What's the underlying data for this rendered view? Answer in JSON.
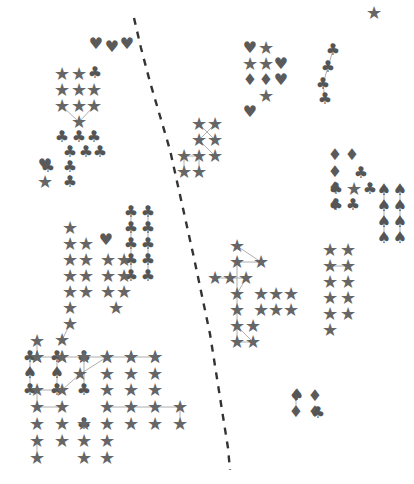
{
  "chart_data": {
    "type": "scatter",
    "title": "",
    "subtitle": "",
    "xlabel": "",
    "ylabel": "",
    "xlim": [
      0,
      414
    ],
    "ylim": [
      0,
      484
    ],
    "grid": false,
    "legend": "none",
    "background_color": "#ffffff",
    "marker_colors": {
      "star": "#666666",
      "club": "#555555",
      "spade": "#555555",
      "heart": "#5a5a5a",
      "diamond": "#5a5a5a"
    },
    "edge_color": "#999999",
    "divider_color": "#333333",
    "glyph_legend": [
      {
        "name": "star",
        "symbol": "★",
        "label": "star"
      },
      {
        "name": "club",
        "symbol": "♣",
        "label": "club"
      },
      {
        "name": "spade",
        "symbol": "♠",
        "label": "spade"
      },
      {
        "name": "heart",
        "symbol": "♥",
        "label": "heart"
      },
      {
        "name": "diamond",
        "symbol": "♦",
        "label": "diamond"
      }
    ],
    "annotations": [
      {
        "name": "dashed-divider",
        "kind": "dashed-path",
        "points": [
          [
            134,
            18
          ],
          [
            141,
            48
          ],
          [
            150,
            82
          ],
          [
            160,
            116
          ],
          [
            170,
            150
          ],
          [
            178,
            186
          ],
          [
            186,
            222
          ],
          [
            194,
            258
          ],
          [
            202,
            296
          ],
          [
            210,
            334
          ],
          [
            216,
            372
          ],
          [
            222,
            410
          ],
          [
            228,
            448
          ],
          [
            230,
            470
          ]
        ]
      }
    ],
    "series": [
      {
        "name": "cluster-top-left-hearts",
        "glyph": "heart",
        "points": [
          [
            96,
            44
          ],
          [
            112,
            47
          ],
          [
            127,
            44
          ]
        ]
      },
      {
        "name": "cluster-upper-left-stars",
        "glyph": "star",
        "points": [
          [
            62,
            74
          ],
          [
            79,
            74
          ],
          [
            62,
            90
          ],
          [
            79,
            90
          ],
          [
            94,
            90
          ],
          [
            62,
            106
          ],
          [
            79,
            106
          ],
          [
            94,
            106
          ],
          [
            79,
            122
          ]
        ],
        "edges": [
          [
            7,
            8
          ],
          [
            8,
            5
          ]
        ]
      },
      {
        "name": "cluster-upper-left-top-right-club",
        "glyph": "club",
        "points": [
          [
            95,
            73
          ]
        ]
      },
      {
        "name": "cluster-left-clubs",
        "glyph": "club",
        "points": [
          [
            62,
            137
          ],
          [
            79,
            137
          ],
          [
            94,
            137
          ],
          [
            70,
            152
          ],
          [
            86,
            152
          ],
          [
            100,
            152
          ],
          [
            48,
            167
          ],
          [
            70,
            167
          ],
          [
            70,
            182
          ]
        ]
      },
      {
        "name": "cluster-left-heart-single",
        "glyph": "heart",
        "points": [
          [
            45,
            165
          ]
        ]
      },
      {
        "name": "cluster-left-star-single",
        "glyph": "star",
        "points": [
          [
            45,
            182
          ]
        ]
      },
      {
        "name": "cluster-mid-left-stars",
        "glyph": "star",
        "points": [
          [
            70,
            228
          ],
          [
            70,
            244
          ],
          [
            86,
            244
          ],
          [
            70,
            260
          ],
          [
            86,
            260
          ],
          [
            70,
            276
          ],
          [
            86,
            276
          ],
          [
            70,
            292
          ],
          [
            86,
            292
          ],
          [
            70,
            308
          ],
          [
            70,
            324
          ],
          [
            62,
            340
          ]
        ],
        "edges": [
          [
            10,
            11
          ]
        ]
      },
      {
        "name": "cluster-mid-left-heart",
        "glyph": "heart",
        "points": [
          [
            106,
            240
          ]
        ]
      },
      {
        "name": "cluster-mid-clubs-grid",
        "glyph": "club",
        "points": [
          [
            131,
            212
          ],
          [
            148,
            212
          ],
          [
            131,
            228
          ],
          [
            148,
            228
          ],
          [
            131,
            244
          ],
          [
            148,
            244
          ],
          [
            131,
            260
          ],
          [
            148,
            260
          ],
          [
            131,
            276
          ],
          [
            148,
            276
          ]
        ],
        "edges": [
          [
            0,
            2
          ],
          [
            2,
            4
          ],
          [
            4,
            6
          ],
          [
            6,
            8
          ],
          [
            1,
            3
          ],
          [
            3,
            5
          ],
          [
            5,
            7
          ],
          [
            7,
            9
          ]
        ]
      },
      {
        "name": "cluster-mid-left-stars-b",
        "glyph": "star",
        "points": [
          [
            108,
            260
          ],
          [
            124,
            260
          ],
          [
            108,
            276
          ],
          [
            124,
            276
          ],
          [
            108,
            292
          ],
          [
            124,
            292
          ],
          [
            116,
            308
          ]
        ]
      },
      {
        "name": "cluster-upper-mid-stars",
        "glyph": "star",
        "points": [
          [
            199,
            124
          ],
          [
            215,
            124
          ],
          [
            199,
            140
          ],
          [
            215,
            140
          ],
          [
            184,
            156
          ],
          [
            199,
            156
          ],
          [
            215,
            156
          ],
          [
            184,
            172
          ],
          [
            199,
            172
          ]
        ],
        "edges": [
          [
            0,
            3
          ],
          [
            1,
            2
          ],
          [
            2,
            6
          ],
          [
            4,
            5
          ],
          [
            5,
            8
          ],
          [
            4,
            7
          ]
        ]
      },
      {
        "name": "cluster-upper-right-mixed",
        "glyph": "mixed",
        "points": [
          [
            250,
            48
          ],
          [
            266,
            48
          ],
          [
            250,
            64
          ],
          [
            266,
            64
          ],
          [
            281,
            64
          ],
          [
            250,
            80
          ],
          [
            266,
            80
          ],
          [
            281,
            80
          ],
          [
            266,
            96
          ],
          [
            250,
            112
          ]
        ],
        "glyphs": [
          "heart",
          "star",
          "star",
          "star",
          "heart",
          "diamond",
          "diamond",
          "heart",
          "star",
          "heart"
        ]
      },
      {
        "name": "cluster-upper-right-clubs-line",
        "glyph": "club",
        "points": [
          [
            333,
            50
          ],
          [
            328,
            67
          ],
          [
            323,
            84
          ],
          [
            325,
            99
          ]
        ],
        "edges": [
          [
            0,
            1
          ],
          [
            1,
            2
          ],
          [
            2,
            3
          ]
        ]
      },
      {
        "name": "top-right-star",
        "glyph": "star",
        "points": [
          [
            374,
            13
          ]
        ]
      },
      {
        "name": "cluster-right-diamonds",
        "glyph": "diamond",
        "points": [
          [
            335,
            155
          ],
          [
            352,
            155
          ],
          [
            335,
            172
          ],
          [
            335,
            188
          ],
          [
            335,
            205
          ]
        ]
      },
      {
        "name": "cluster-right-clubs-b",
        "glyph": "club",
        "points": [
          [
            361,
            173
          ],
          [
            336,
            189
          ],
          [
            370,
            189
          ],
          [
            336,
            205
          ],
          [
            353,
            205
          ]
        ]
      },
      {
        "name": "cluster-right-star-single",
        "glyph": "star",
        "points": [
          [
            354,
            189
          ]
        ]
      },
      {
        "name": "cluster-right-spades",
        "glyph": "spade",
        "points": [
          [
            384,
            190
          ],
          [
            400,
            190
          ],
          [
            384,
            206
          ],
          [
            400,
            206
          ],
          [
            384,
            222
          ],
          [
            400,
            222
          ],
          [
            384,
            238
          ],
          [
            400,
            238
          ]
        ],
        "edges": [
          [
            0,
            2
          ],
          [
            2,
            4
          ],
          [
            4,
            6
          ],
          [
            1,
            3
          ],
          [
            3,
            5
          ],
          [
            5,
            7
          ]
        ]
      },
      {
        "name": "cluster-center-right-stars",
        "glyph": "star",
        "points": [
          [
            237,
            246
          ],
          [
            237,
            262
          ],
          [
            215,
            278
          ],
          [
            230,
            278
          ],
          [
            246,
            278
          ],
          [
            261,
            262
          ],
          [
            237,
            294
          ],
          [
            261,
            294
          ],
          [
            276,
            294
          ],
          [
            291,
            294
          ],
          [
            237,
            310
          ],
          [
            261,
            310
          ],
          [
            276,
            310
          ],
          [
            291,
            310
          ],
          [
            237,
            326
          ],
          [
            253,
            326
          ],
          [
            237,
            342
          ],
          [
            253,
            342
          ]
        ],
        "edges": [
          [
            0,
            5
          ],
          [
            1,
            6
          ],
          [
            2,
            3
          ],
          [
            3,
            4
          ],
          [
            4,
            6
          ],
          [
            5,
            1
          ],
          [
            6,
            10
          ],
          [
            10,
            14
          ],
          [
            14,
            16
          ],
          [
            14,
            17
          ],
          [
            16,
            17
          ]
        ]
      },
      {
        "name": "cluster-far-right-stars",
        "glyph": "star",
        "points": [
          [
            330,
            250
          ],
          [
            348,
            250
          ],
          [
            330,
            266
          ],
          [
            348,
            266
          ],
          [
            330,
            282
          ],
          [
            348,
            282
          ],
          [
            330,
            298
          ],
          [
            348,
            298
          ],
          [
            330,
            314
          ],
          [
            348,
            314
          ],
          [
            330,
            330
          ]
        ],
        "edges": [
          [
            2,
            3
          ]
        ]
      },
      {
        "name": "cluster-bottom-left-clubs",
        "glyph": "club",
        "points": [
          [
            30,
            357
          ],
          [
            57,
            357
          ],
          [
            30,
            390
          ],
          [
            57,
            390
          ],
          [
            84,
            390
          ],
          [
            84,
            357
          ],
          [
            84,
            424
          ]
        ],
        "edges": [
          [
            0,
            2
          ],
          [
            1,
            3
          ],
          [
            5,
            4
          ]
        ]
      },
      {
        "name": "cluster-bottom-left-spades",
        "glyph": "spade",
        "points": [
          [
            30,
            373
          ],
          [
            57,
            373
          ]
        ]
      },
      {
        "name": "cluster-bottom-stars-row1",
        "glyph": "star",
        "points": [
          [
            37,
            357
          ],
          [
            62,
            357
          ],
          [
            84,
            357
          ],
          [
            107,
            357
          ],
          [
            131,
            357
          ],
          [
            155,
            357
          ]
        ],
        "edges": [
          [
            0,
            1
          ],
          [
            1,
            2
          ],
          [
            2,
            3
          ],
          [
            3,
            4
          ],
          [
            4,
            5
          ]
        ]
      },
      {
        "name": "cluster-bottom-stars-grid",
        "glyph": "star",
        "points": [
          [
            37,
            341
          ],
          [
            37,
            357
          ],
          [
            62,
            357
          ],
          [
            84,
            357
          ],
          [
            107,
            357
          ],
          [
            131,
            357
          ],
          [
            155,
            357
          ],
          [
            80,
            374
          ],
          [
            62,
            390
          ],
          [
            37,
            390
          ],
          [
            107,
            374
          ],
          [
            131,
            374
          ],
          [
            155,
            374
          ],
          [
            107,
            390
          ],
          [
            131,
            390
          ],
          [
            155,
            390
          ],
          [
            37,
            407
          ],
          [
            62,
            407
          ],
          [
            107,
            407
          ],
          [
            131,
            407
          ],
          [
            155,
            407
          ],
          [
            180,
            407
          ],
          [
            37,
            424
          ],
          [
            62,
            424
          ],
          [
            84,
            424
          ],
          [
            107,
            424
          ],
          [
            131,
            424
          ],
          [
            155,
            424
          ],
          [
            180,
            424
          ],
          [
            37,
            441
          ],
          [
            62,
            441
          ],
          [
            84,
            441
          ],
          [
            107,
            441
          ],
          [
            37,
            458
          ],
          [
            84,
            458
          ],
          [
            107,
            458
          ]
        ],
        "edges": [
          [
            0,
            1
          ],
          [
            9,
            8
          ],
          [
            8,
            7
          ],
          [
            7,
            4
          ],
          [
            9,
            16
          ],
          [
            16,
            17
          ],
          [
            18,
            20
          ],
          [
            20,
            21
          ],
          [
            21,
            28
          ],
          [
            29,
            33
          ]
        ]
      },
      {
        "name": "cluster-bottom-right-diamonds",
        "glyph": "diamond",
        "points": [
          [
            296,
            396
          ],
          [
            315,
            396
          ],
          [
            296,
            412
          ],
          [
            315,
            412
          ]
        ],
        "edges": [
          [
            0,
            2
          ]
        ]
      },
      {
        "name": "cluster-bottom-right-spade",
        "glyph": "spade",
        "points": [
          [
            297,
            395
          ]
        ]
      },
      {
        "name": "cluster-bottom-right-club",
        "glyph": "club",
        "points": [
          [
            318,
            413
          ]
        ]
      }
    ]
  },
  "figure": {
    "width": 414,
    "height": 484,
    "caption": ""
  }
}
